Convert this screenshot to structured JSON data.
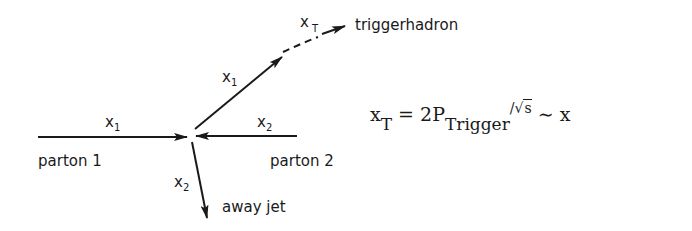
{
  "diagram": {
    "type": "parton-scattering-kinematics",
    "incoming": [
      {
        "label": "parton 1",
        "momentum_fraction": "x",
        "subscript": "1",
        "direction": "right"
      },
      {
        "label": "parton 2",
        "momentum_fraction": "x",
        "subscript": "2",
        "direction": "left"
      }
    ],
    "outgoing": [
      {
        "momentum_fraction": "x",
        "subscript": "1",
        "direction": "up-right"
      },
      {
        "label": "triggerhadron",
        "momentum_fraction": "x",
        "subscript": "T",
        "style": "dashed"
      },
      {
        "label": "away jet",
        "momentum_fraction": "x",
        "subscript": "2",
        "direction": "down"
      }
    ],
    "labels": {
      "parton1": "parton 1",
      "parton2": "parton 2",
      "away_jet": "away jet",
      "trigger_hadron": "triggerhadron",
      "x": "x",
      "sub1": "1",
      "sub2": "2",
      "subT": "T"
    }
  },
  "formula": {
    "lhs_var": "x",
    "lhs_sub": "T",
    "equals": "=",
    "coef": "2P",
    "p_sub": "Trigger",
    "slash": "/",
    "sqrt_sym": "√",
    "sqrt_arg": "s",
    "approx": "∼",
    "rhs": "x"
  },
  "colors": {
    "ink": "#1a1a1a",
    "background": "#ffffff"
  }
}
